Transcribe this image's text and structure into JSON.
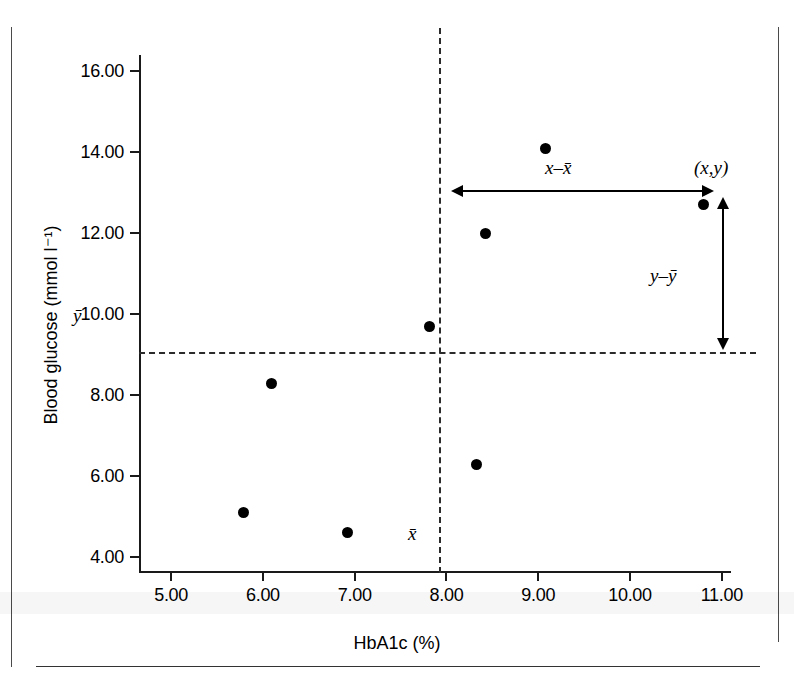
{
  "chart_data": {
    "type": "scatter",
    "title": "",
    "xlabel": "HbA1c (%)",
    "ylabel": "Blood glucose (mmol l⁻¹)",
    "xlim": [
      4.65,
      11.1
    ],
    "ylim": [
      3.6,
      16.4
    ],
    "grid": false,
    "legend": null,
    "x_ticks": [
      "5.00",
      "6.00",
      "7.00",
      "8.00",
      "9.00",
      "10.00",
      "11.00"
    ],
    "x_tick_values": [
      5,
      6,
      7,
      8,
      9,
      10,
      11
    ],
    "y_ticks": [
      "4.00",
      "6.00",
      "8.00",
      "10.00",
      "12.00",
      "14.00",
      "16.00"
    ],
    "y_tick_values": [
      4,
      6,
      8,
      10,
      12,
      14,
      16
    ],
    "points": [
      {
        "x": 5.79,
        "y": 5.1
      },
      {
        "x": 6.09,
        "y": 8.28
      },
      {
        "x": 6.92,
        "y": 4.6
      },
      {
        "x": 7.82,
        "y": 9.68
      },
      {
        "x": 8.33,
        "y": 6.28
      },
      {
        "x": 8.42,
        "y": 12.0
      },
      {
        "x": 9.08,
        "y": 14.1
      },
      {
        "x": 10.8,
        "y": 12.7
      }
    ],
    "mean_x": 7.93,
    "mean_y": 9.03,
    "annotations": [
      {
        "name": "x-deviation",
        "label": "x–x̄",
        "kind": "double-arrow-horizontal"
      },
      {
        "name": "y-deviation",
        "label": "y–ȳ",
        "kind": "double-arrow-vertical"
      },
      {
        "name": "point-label",
        "label": "(x,y)",
        "kind": "text"
      },
      {
        "name": "mean-x-label",
        "label": "x̄",
        "kind": "text"
      },
      {
        "name": "mean-y-label",
        "label": "ȳ",
        "kind": "text"
      }
    ],
    "colors": {
      "marker": "#000000",
      "axis": "#1a1a1a",
      "mean_line": "#2b2b2b",
      "background": "#ffffff"
    }
  }
}
